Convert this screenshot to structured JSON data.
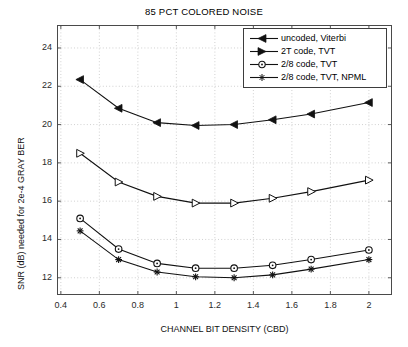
{
  "chart_data": {
    "type": "line",
    "title": "85 PCT COLORED NOISE",
    "xlabel": "CHANNEL BIT DENSITY (CBD)",
    "ylabel": "SNR (dB) needed for 2e-4 GRAY BER",
    "xlim": [
      0.38,
      2.12
    ],
    "ylim": [
      11.1,
      25.2
    ],
    "xticks": [
      0.4,
      0.6,
      0.8,
      1,
      1.2,
      1.4,
      1.6,
      1.8,
      2
    ],
    "xtick_labels": [
      "0.4",
      "0.6",
      "0.8",
      "1",
      "1.2",
      "1.4",
      "1.6",
      "1.8",
      "2"
    ],
    "yticks": [
      12,
      14,
      16,
      18,
      20,
      22,
      24
    ],
    "ytick_labels": [
      "12",
      "14",
      "16",
      "18",
      "20",
      "22",
      "24"
    ],
    "grid": true,
    "legend_position": "upper right",
    "x": [
      0.5,
      0.7,
      0.9,
      1.1,
      1.3,
      1.5,
      1.7,
      2.0
    ],
    "series": [
      {
        "name": "uncoded, Viterbi",
        "marker": "left-triangle",
        "color": "#111111",
        "values": [
          22.35,
          20.85,
          20.1,
          19.95,
          20.0,
          20.25,
          20.55,
          21.15
        ]
      },
      {
        "name": "2T code, TVT",
        "marker": "right-triangle",
        "color": "#111111",
        "values": [
          18.5,
          17.0,
          16.25,
          15.9,
          15.9,
          16.15,
          16.5,
          17.1
        ]
      },
      {
        "name": "2/8 code, TVT",
        "marker": "circle",
        "color": "#111111",
        "values": [
          15.1,
          13.5,
          12.75,
          12.5,
          12.5,
          12.65,
          12.95,
          13.45
        ]
      },
      {
        "name": "2/8 code, TVT, NPML",
        "marker": "star",
        "color": "#111111",
        "values": [
          14.45,
          12.95,
          12.3,
          12.05,
          12.0,
          12.15,
          12.45,
          12.95
        ]
      }
    ]
  },
  "legend": {
    "entries": [
      "uncoded, Viterbi",
      "2T code, TVT",
      "2/8 code, TVT",
      "2/8 code, TVT, NPML"
    ]
  }
}
